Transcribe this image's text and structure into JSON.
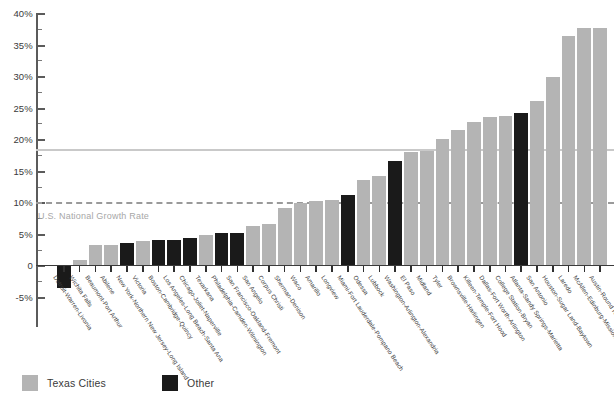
{
  "chart_data": {
    "type": "bar",
    "title": "",
    "xlabel": "",
    "ylabel": "",
    "ylim": [
      -5,
      40
    ],
    "grid": false,
    "legend_position": "bottom-left",
    "y_ticks": [
      "40%",
      "35%",
      "30%",
      "25%",
      "20%",
      "15%",
      "10%",
      "5%",
      "0",
      "-5%"
    ],
    "y_tick_values": [
      40,
      35,
      30,
      25,
      20,
      15,
      10,
      5,
      0,
      -5
    ],
    "annotations": [
      {
        "label": "U.S. National Growth Rate",
        "value": 10,
        "style": "dashed",
        "color": "#9a9a9a"
      },
      {
        "label": "",
        "value": 18.4,
        "style": "solid",
        "color": "#c9c9c9"
      }
    ],
    "legend": [
      {
        "name": "Texas Cities",
        "color": "#b4b4b4",
        "key": "tx"
      },
      {
        "name": "Other",
        "color": "#1a1a1a",
        "key": "other"
      }
    ],
    "categories": [
      "Detroit-Warren-Livonia",
      "Wichita Falls",
      "Beaumont-Port Arthur",
      "Abilene",
      "New York-Northern New Jersey-Long Island",
      "Victoria",
      "Boston-Cambridge-Quincy",
      "Los Angeles-Long Beach-Santa Ana",
      "Chicago-Joliet-Naperville",
      "Texarkana",
      "Philadelphia-Camden-Wilmington",
      "San Francisco-Oakland-Fremont",
      "San Angelo",
      "Corpus Christi",
      "Sherman-Denison",
      "Waco",
      "Amarillo",
      "Longview",
      "Miami-Fort Lauderdale-Pompano Beach",
      "Odessa",
      "Lubbock",
      "Washington-Arlington-Alexandria",
      "El Paso",
      "Midland",
      "Tyler",
      "Brownsville-Harlingen",
      "Killeen-Temple-Fort Hood",
      "Dallas-Fort Worth-Arlington",
      "College Station-Bryan",
      "Atlanta-Sandy Springs-Marietta",
      "San Antonio",
      "Houston-Sugar Land-Baytown",
      "Laredo",
      "McAllen-Edinburg-Mission",
      "Austin-Round Rock"
    ],
    "values": [
      -3.5,
      0.9,
      3.2,
      3.3,
      3.5,
      3.9,
      4.0,
      4.1,
      4.3,
      4.9,
      5.1,
      5.2,
      6.2,
      6.6,
      9.1,
      9.9,
      10.2,
      10.3,
      11.1,
      13.5,
      14.2,
      16.6,
      18.0,
      18.2,
      20.1,
      21.4,
      22.8,
      23.5,
      23.7,
      24.2,
      26.1,
      29.8,
      36.3,
      37.6,
      37.6
    ],
    "groups": [
      "other",
      "tx",
      "tx",
      "tx",
      "other",
      "tx",
      "other",
      "other",
      "other",
      "tx",
      "other",
      "other",
      "tx",
      "tx",
      "tx",
      "tx",
      "tx",
      "tx",
      "other",
      "tx",
      "tx",
      "other",
      "tx",
      "tx",
      "tx",
      "tx",
      "tx",
      "tx",
      "tx",
      "other",
      "tx",
      "tx",
      "tx",
      "tx",
      "tx"
    ]
  }
}
